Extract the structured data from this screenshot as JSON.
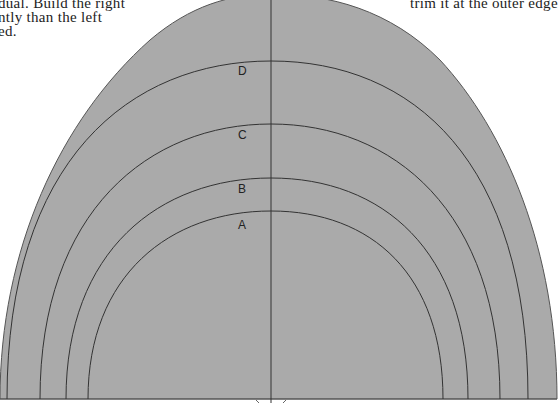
{
  "text_fragments": {
    "left_line1": "dual. Build the right",
    "left_line2": "ntly than the left",
    "left_line3": "ed.",
    "right_line1": "trim it at the outer edge"
  },
  "diagram": {
    "fill_color": "#aaaaaa",
    "line_color": "#333333",
    "center_line_x": 271,
    "arcs": [
      {
        "label": "D",
        "top_y": 61,
        "left_x": 7,
        "right_x": 528
      },
      {
        "label": "C",
        "top_y": 124,
        "left_x": 40,
        "right_x": 500
      },
      {
        "label": "B",
        "top_y": 178,
        "left_x": 66,
        "right_x": 468
      },
      {
        "label": "A",
        "top_y": 211,
        "left_x": 88,
        "right_x": 443
      }
    ]
  }
}
